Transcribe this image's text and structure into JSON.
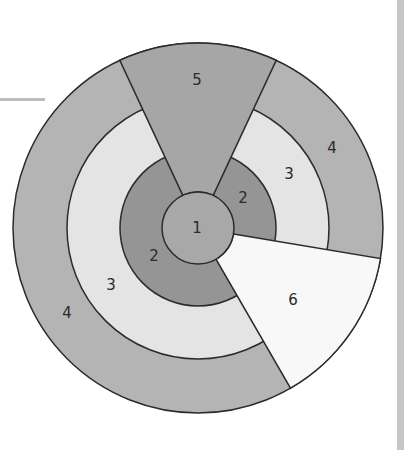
{
  "diagram": {
    "type": "concentric-ring-diagram",
    "center": {
      "label": "1",
      "color": "#a8a8a8"
    },
    "rings": [
      {
        "id": "ring-2",
        "color": "#959595",
        "labels": [
          "2",
          "2"
        ]
      },
      {
        "id": "ring-3",
        "color": "#e4e4e4",
        "labels": [
          "3",
          "3"
        ]
      },
      {
        "id": "ring-4",
        "color": "#b4b4b4",
        "labels": [
          "4",
          "4"
        ]
      }
    ],
    "wedges": [
      {
        "id": "wedge-5",
        "label": "5",
        "color": "#a6a6a6"
      },
      {
        "id": "wedge-6",
        "label": "6",
        "color": "#f8f8f8"
      }
    ],
    "stroke_color": "#2b2b2b",
    "labels": {
      "c1": "1",
      "r2a": "2",
      "r2b": "2",
      "r3a": "3",
      "r3b": "3",
      "r4a": "4",
      "r4b": "4",
      "w5": "5",
      "w6": "6"
    }
  }
}
